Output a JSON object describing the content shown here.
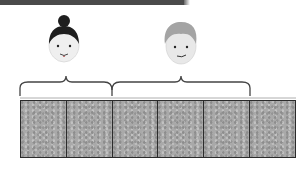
{
  "diagram": {
    "people": [
      {
        "name": "woman",
        "hair": "dark bun",
        "span_tiles": 2
      },
      {
        "name": "man",
        "hair": "light gray short",
        "span_tiles": 3
      }
    ],
    "tiles": {
      "count": 6,
      "fill": "#a9a9a9",
      "border": "#2b2b2b"
    },
    "colors": {
      "topbar": "#4a4a4a",
      "bracket": "#444444",
      "baseline": "#888888"
    }
  }
}
